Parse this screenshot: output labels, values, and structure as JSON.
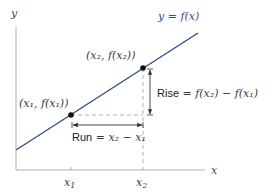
{
  "diagram": {
    "type": "slope-secant-line",
    "axes": {
      "x_label": "x",
      "y_label": "y",
      "ticks": [
        {
          "label": "x",
          "sub": "1"
        },
        {
          "label": "x",
          "sub": "2"
        }
      ]
    },
    "curve_label": "y = f(x)",
    "points": [
      {
        "label": "(x₁, f(x₁))"
      },
      {
        "label": "(x₂, f(x₂))"
      }
    ],
    "run_label": "Run = x₂ − x₁",
    "run_word": "Run",
    "run_expr": " = x₂ − x₁",
    "rise_label": "Rise = f(x₂) − f(x₁)",
    "rise_word": "Rise",
    "rise_expr": " = f(x₂) − f(x₁)"
  },
  "colors": {
    "line": "#2f4f8a",
    "axis": "#b0b0b0",
    "dashed": "#aaaaaa",
    "point": "#111111",
    "arrow": "#333333"
  }
}
